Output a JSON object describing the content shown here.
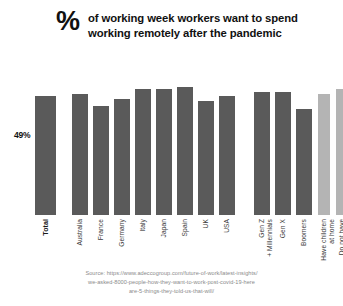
{
  "title": {
    "percent_glyph": "%",
    "line1": "of working week workers want to spend",
    "line2": "working remotely after the pandemic"
  },
  "value_label": "49%",
  "colors": {
    "bar_dark": "#5a5a5a",
    "bar_light": "#b4b4b4",
    "text": "#111111",
    "source_text": "#8a8a8a",
    "background": "#ffffff"
  },
  "source": {
    "line1": "Source: https://www.adeccogroup.com/future-of-work/latest-insights/",
    "line2": "we-asked-8000-people-how-they-want-to-work-post-covid-19-here",
    "line3": "are-5-things-they-told-us-that-will/"
  },
  "chart_data": {
    "type": "bar",
    "title": "% of working week workers want to spend working remotely after the pandemic",
    "xlabel": "",
    "ylabel": "",
    "ylim": [
      0,
      60
    ],
    "grid": false,
    "legend": "none",
    "categories": [
      "Total",
      "Australia",
      "France",
      "Germany",
      "Italy",
      "Japan",
      "Spain",
      "UK",
      "USA",
      "Gen Z\n+ Millennials",
      "Gen X",
      "Boomers",
      "Have children\nat home",
      "Do not have\nchildren at home"
    ],
    "values": [
      49,
      50,
      45,
      48,
      52,
      52,
      53,
      47,
      49,
      51,
      51,
      44,
      50,
      52
    ],
    "data_labels": [
      "49%",
      "",
      "",
      "",
      "",
      "",
      "",
      "",
      "",
      "",
      "",
      "",
      "",
      ""
    ],
    "groups": [
      {
        "name": "overall",
        "categories": [
          "Total"
        ],
        "color": "#5a5a5a"
      },
      {
        "name": "countries",
        "categories": [
          "Australia",
          "France",
          "Germany",
          "Italy",
          "Japan",
          "Spain",
          "UK",
          "USA"
        ],
        "color": "#5a5a5a"
      },
      {
        "name": "generations",
        "categories": [
          "Gen Z + Millennials",
          "Gen X",
          "Boomers"
        ],
        "color": "#5a5a5a"
      },
      {
        "name": "children",
        "categories": [
          "Have children at home",
          "Do not have children at home"
        ],
        "color": "#b4b4b4"
      }
    ]
  }
}
